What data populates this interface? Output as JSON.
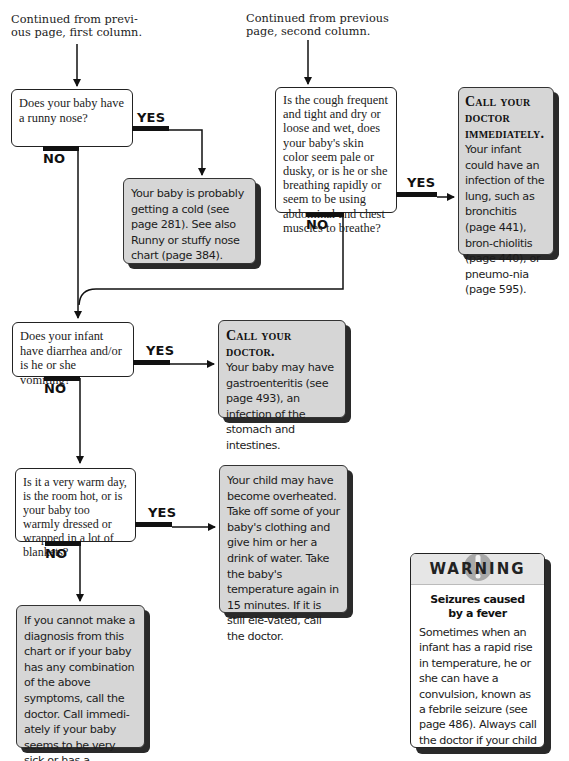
{
  "captions": {
    "first_column": [
      "Continued from previ-",
      "ous page, first column."
    ],
    "second_column": [
      "Continued from previous",
      "page, second column."
    ]
  },
  "branch_labels": {
    "yes": "YES",
    "no": "NO"
  },
  "questions": [
    {
      "id": "q1",
      "text": "Does your baby have a runny nose?"
    },
    {
      "id": "q2",
      "text": "Is the cough frequent and tight and dry or loose and wet, does your baby's skin color seem pale or dusky, or is he or she breathing rapidly or seem to be using abdominal and chest muscles to breathe?"
    },
    {
      "id": "q3",
      "text": "Does your infant have diarrhea and/or is he or she vomiting?"
    },
    {
      "id": "q4",
      "text": "Is it a very warm day, is the room hot, or is your baby too warmly dressed or wrapped in a lot of blankets?"
    }
  ],
  "answers": [
    {
      "id": "a1",
      "heading": "",
      "text": "Your baby is probably getting a cold (see page 281). See also Runny or stuffy nose chart (page 384)."
    },
    {
      "id": "a2",
      "heading": "Call your doctor immediately.",
      "text": "Your infant could have an infection of the lung, such as bronchitis (page 441), bron-chiolitis (page 440), or pneumo-nia (page 595)."
    },
    {
      "id": "a3",
      "heading": "Call your doctor.",
      "text": "Your baby may have gastroenteritis (see page 493), an infection of the stomach and intestines."
    },
    {
      "id": "a4",
      "heading": "",
      "text": "Your child may have become overheated. Take off some of your baby's clothing and give him or her a drink of water. Take the baby's temperature again in 15 minutes. If it is still ele-vated, call the doctor."
    },
    {
      "id": "a5",
      "heading": "",
      "text": "If you cannot make a diagnosis from this chart or if your baby has any combination of the above symptoms, call the doctor. Call immedi-ately if your baby seems to be very sick or has a temperature of 101.5°F or higher."
    }
  ],
  "warning": {
    "title": "WARNING",
    "icon": "exclamation-icon",
    "subtitle": [
      "Seizures caused",
      "by a fever"
    ],
    "text": "Sometimes when an infant has a rapid rise in temperature, he or she can have a convulsion, known as a febrile seizure (see page 486). Always call the doctor if your child has a seizure."
  },
  "colors": {
    "answer_fill": "#d6d6d6",
    "question_fill": "#ffffff",
    "line": "#111111",
    "shadow": "#2a2a2a"
  }
}
